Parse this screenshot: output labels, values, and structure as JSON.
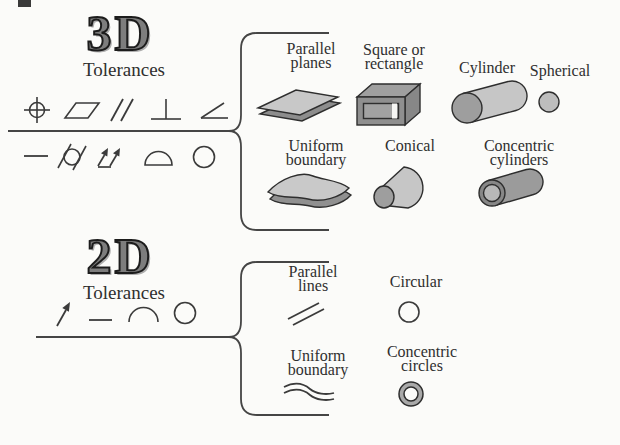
{
  "canvas": {
    "background": "#fbfbf9",
    "ink": "#2f2f2f",
    "line_color": "#454545",
    "shape_light": "#c8c8c8",
    "shape_mid": "#9e9e9e",
    "shape_dark": "#8a8a8a"
  },
  "sections": {
    "d3": {
      "title": "3D",
      "subtitle": "Tolerances",
      "symbols_row1": [
        "position",
        "flatness",
        "parallelism",
        "perpendicularity",
        "angularity"
      ],
      "symbols_row2": [
        "straightness",
        "cylindricity",
        "total-runout",
        "profile-of-surface",
        "circularity"
      ],
      "items": [
        {
          "line1": "Parallel",
          "line2": "planes",
          "shape": "parallel-planes"
        },
        {
          "line1": "Square or",
          "line2": "rectangle",
          "shape": "hollow-box"
        },
        {
          "line1": "Cylinder",
          "line2": "",
          "shape": "cylinder"
        },
        {
          "line1": "Spherical",
          "line2": "",
          "shape": "sphere"
        },
        {
          "line1": "Uniform",
          "line2": "boundary",
          "shape": "wavy-surface"
        },
        {
          "line1": "Conical",
          "line2": "",
          "shape": "cone"
        },
        {
          "line1": "Concentric",
          "line2": "cylinders",
          "shape": "concentric-cylinders"
        }
      ]
    },
    "d2": {
      "title": "2D",
      "subtitle": "Tolerances",
      "symbols_row": [
        "runout-arrow",
        "straightness",
        "profile-of-line",
        "circularity"
      ],
      "items": [
        {
          "line1": "Parallel",
          "line2": "lines",
          "shape": "parallel-lines"
        },
        {
          "line1": "Circular",
          "line2": "",
          "shape": "circle"
        },
        {
          "line1": "Uniform",
          "line2": "boundary",
          "shape": "wavy-lines"
        },
        {
          "line1": "Concentric",
          "line2": "circles",
          "shape": "concentric-circles"
        }
      ]
    }
  }
}
